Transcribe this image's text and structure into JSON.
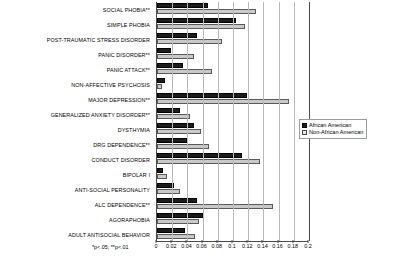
{
  "chart_data": {
    "type": "bar",
    "orientation": "horizontal",
    "title": "",
    "xlabel": "",
    "ylabel": "",
    "xlim": [
      0,
      0.2
    ],
    "xticks": [
      "0",
      "0.02",
      "0.04",
      "0.06",
      "0.08",
      "0.1",
      "0.12",
      "0.14",
      "0.16",
      "0.18",
      "0.2"
    ],
    "xtick_values": [
      0,
      0.02,
      0.04,
      0.06,
      0.08,
      0.1,
      0.12,
      0.14,
      0.16,
      0.18,
      0.2
    ],
    "grid": true,
    "grid_axis": "x",
    "legend_position": "right",
    "categories": [
      "SOCIAL PHOBIA**",
      "SIMPLE PHOBIA",
      "POST-TRAUMATIC STRESS DISORDER",
      "PANIC DISORDER**",
      "PANIC ATTACK**",
      "NON-AFFECTIVE PSYCHOSIS",
      "MAJOR DEPRESSION**",
      "GENERALIZED ANXIETY DISORDER**",
      "DYSTHYMIA",
      "DRG DEPENDENCE**",
      "CONDUCT DISORDER",
      "BIPOLAR I",
      "ANTI-SOCIAL PERSONALITY",
      "ALC DEPENDENCE**",
      "AGORAPHOBIA",
      "ADULT ANTISOCIAL BEHAVIOR"
    ],
    "series": [
      {
        "name": "African American",
        "color": "#1c1c1c",
        "values": [
          0.067,
          0.104,
          0.053,
          0.018,
          0.034,
          0.01,
          0.118,
          0.03,
          0.049,
          0.04,
          0.112,
          0.008,
          0.022,
          0.053,
          0.06,
          0.037
        ]
      },
      {
        "name": "Non-African American",
        "color": "#c9c9c9",
        "values": [
          0.13,
          0.116,
          0.086,
          0.049,
          0.073,
          0.007,
          0.174,
          0.043,
          0.058,
          0.068,
          0.136,
          0.013,
          0.03,
          0.153,
          0.055,
          0.05
        ]
      }
    ]
  },
  "legend": {
    "items": [
      {
        "label": "African American"
      },
      {
        "label": "Non-African American"
      }
    ]
  },
  "notes": {
    "significance": "*p<.05; **p<.01"
  }
}
